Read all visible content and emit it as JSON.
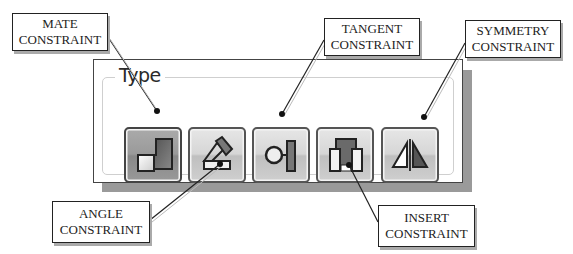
{
  "panel": {
    "group_title": "Type"
  },
  "buttons": [
    {
      "id": "mate",
      "icon": "mate-constraint-icon",
      "active": true
    },
    {
      "id": "angle",
      "icon": "angle-constraint-icon",
      "active": false
    },
    {
      "id": "tangent",
      "icon": "tangent-constraint-icon",
      "active": false
    },
    {
      "id": "insert",
      "icon": "insert-constraint-icon",
      "active": false
    },
    {
      "id": "symmetry",
      "icon": "symmetry-constraint-icon",
      "active": false
    }
  ],
  "callouts": {
    "mate": {
      "line1": "MATE",
      "line2": "CONSTRAINT"
    },
    "tangent": {
      "line1": "TANGENT",
      "line2": "CONSTRAINT"
    },
    "symmetry": {
      "line1": "SYMMETRY",
      "line2": "CONSTRAINT"
    },
    "angle": {
      "line1": "ANGLE",
      "line2": "CONSTRAINT"
    },
    "insert": {
      "line1": "INSERT",
      "line2": "CONSTRAINT"
    }
  }
}
